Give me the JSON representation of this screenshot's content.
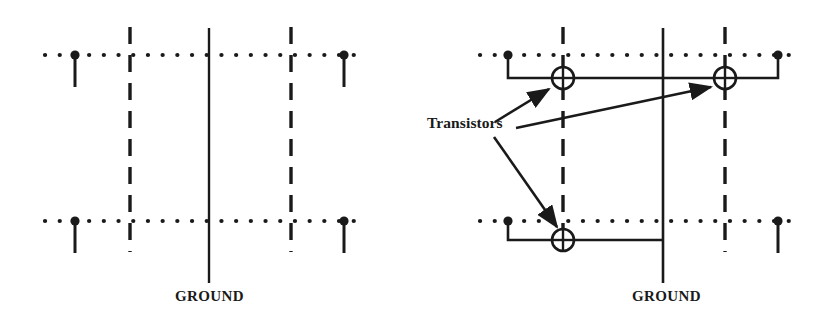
{
  "figure": {
    "kind": "schematic-diagram",
    "background_color": "#ffffff",
    "ink_color": "#1a1a1a"
  },
  "labels": {
    "ground_left": "GROUND",
    "ground_right": "GROUND",
    "transistors": "Transistors"
  },
  "panels": [
    {
      "id": "left-panel",
      "name": "grid-without-transistors",
      "ground_label": "GROUND",
      "ground_line": {
        "x": 209,
        "y_top": 28,
        "y_bottom": 283,
        "style": "solid"
      },
      "dashed_lines": [
        {
          "x": 130,
          "y_top": 27,
          "y_bottom": 252,
          "style": "dashed"
        },
        {
          "x": 291,
          "y_top": 27,
          "y_bottom": 252,
          "style": "dashed"
        }
      ],
      "dotted_rows": [
        {
          "y": 55,
          "x_start": 45,
          "x_end": 368,
          "style": "dotted"
        },
        {
          "y": 221,
          "x_start": 45,
          "x_end": 368,
          "style": "dotted"
        }
      ],
      "pins": [
        {
          "x": 75,
          "y": 55,
          "drop_to": 87,
          "row": "top",
          "side": "left"
        },
        {
          "x": 344,
          "y": 55,
          "drop_to": 87,
          "row": "top",
          "side": "right"
        },
        {
          "x": 75,
          "y": 221,
          "drop_to": 253,
          "row": "bottom",
          "side": "left"
        },
        {
          "x": 344,
          "y": 221,
          "drop_to": 253,
          "row": "bottom",
          "side": "right"
        }
      ],
      "transistors": []
    },
    {
      "id": "right-panel",
      "name": "grid-with-transistors",
      "ground_label": "GROUND",
      "ground_line": {
        "x": 663,
        "y_top": 28,
        "y_bottom": 283,
        "style": "solid"
      },
      "dashed_lines": [
        {
          "x": 563,
          "y_top": 27,
          "y_bottom": 252,
          "style": "dashed"
        },
        {
          "x": 725,
          "y_top": 27,
          "y_bottom": 252,
          "style": "dashed"
        }
      ],
      "dotted_rows": [
        {
          "y": 55,
          "x_start": 480,
          "x_end": 800,
          "style": "dotted"
        },
        {
          "y": 221,
          "x_start": 480,
          "x_end": 800,
          "style": "dotted"
        }
      ],
      "pins": [
        {
          "x": 508,
          "y": 55,
          "row": "top",
          "side": "left"
        },
        {
          "x": 778,
          "y": 55,
          "row": "top",
          "side": "right"
        },
        {
          "x": 508,
          "y": 221,
          "row": "bottom",
          "side": "left"
        },
        {
          "x": 778,
          "y": 221,
          "drop_to": 253,
          "row": "bottom",
          "side": "right"
        }
      ],
      "transistors": [
        {
          "id": "t1",
          "cx": 563,
          "cy": 78,
          "r": 11,
          "row": "top",
          "position": "left"
        },
        {
          "id": "t2",
          "cx": 725,
          "cy": 78,
          "r": 11,
          "row": "top",
          "position": "right"
        },
        {
          "id": "t3",
          "cx": 563,
          "cy": 240,
          "r": 11,
          "row": "bottom",
          "position": "left"
        }
      ],
      "connection_wires": [
        {
          "from": "pin-top-left",
          "to": "transistor-t1",
          "path": "508,55 -> 508,78 -> 563,78"
        },
        {
          "from": "transistor-t1",
          "to": "transistor-t2",
          "path": "563,78 -> 725,78"
        },
        {
          "from": "transistor-t2",
          "to": "pin-top-right",
          "path": "725,78 -> 778,78 -> 778,55"
        },
        {
          "from": "pin-bottom-left",
          "to": "transistor-t3",
          "path": "508,221 -> 508,240 -> 563,240"
        },
        {
          "from": "transistor-t3",
          "to": "ground-line",
          "path": "563,240 -> 663,240"
        }
      ],
      "annotation_arrows": [
        {
          "from": "transistors-label",
          "to": "transistor-t1",
          "start": [
            495,
            122
          ],
          "end": [
            551,
            88
          ]
        },
        {
          "from": "transistors-label",
          "to": "transistor-t2",
          "start": [
            516,
            128
          ],
          "end": [
            713,
            86
          ]
        },
        {
          "from": "transistors-label",
          "to": "transistor-t3",
          "start": [
            494,
            137
          ],
          "end": [
            556,
            228
          ]
        }
      ]
    }
  ]
}
